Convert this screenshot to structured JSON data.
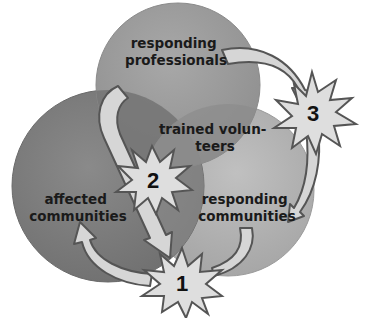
{
  "diagram": {
    "type": "venn-cycle",
    "circles": [
      {
        "id": "top",
        "label_lines": [
          "responding",
          "professionals"
        ],
        "color": "#9b9b9b"
      },
      {
        "id": "left",
        "label_lines": [
          "affected",
          "communities"
        ],
        "color": "#7f7f7f"
      },
      {
        "id": "right",
        "label_lines": [
          "responding",
          "communities"
        ],
        "color": "#b3b3b3"
      }
    ],
    "overlap_label_lines": [
      "trained volun-",
      "teers"
    ],
    "steps": [
      {
        "number": "1"
      },
      {
        "number": "2"
      },
      {
        "number": "3"
      }
    ],
    "colors": {
      "arrow_fill": "#d6d6d6",
      "arrow_stroke": "#555555",
      "burst_fill": "#dedede",
      "burst_stroke": "#555555",
      "overlap_top_left": "#6f6f6f",
      "overlap_top_right": "#8d8d8d"
    }
  }
}
